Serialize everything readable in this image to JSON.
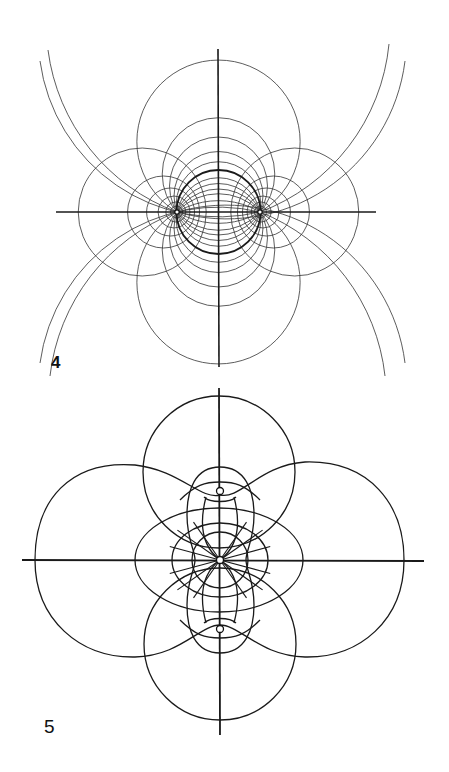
{
  "page": {
    "background": "#ffffff",
    "ink": "#1a1a1a"
  },
  "figures": [
    {
      "id": "figure-4",
      "label": "4",
      "description": "Field lines and equipotentials of two point charges (bipolar coordinate grid)",
      "axes": {
        "horizontal": {
          "x1": 56,
          "y1": 212,
          "x2": 376,
          "y2": 212
        },
        "vertical": {
          "x1": 218,
          "y1": 49,
          "x2": 219,
          "y2": 367
        }
      },
      "charges": [
        {
          "name": "left-charge",
          "x": 177,
          "y": 212
        },
        {
          "name": "right-charge",
          "x": 260,
          "y": 212
        }
      ],
      "center": {
        "x": 218.5,
        "y": 212
      },
      "half_separation": 41.5,
      "bold_circle": {
        "cx": 218.5,
        "cy": 212,
        "r": 42
      },
      "through_circle_offsets": [
        8,
        16,
        26,
        38,
        70.3
      ],
      "apollonian_radii": [
        6,
        10,
        16,
        24,
        36,
        64
      ],
      "leaf_arcs": [
        {
          "d": "M40,61 A180,180 0 0 0 260,212"
        },
        {
          "d": "M405,61 A180,180 0 0 1 177,212"
        },
        {
          "d": "M40,363 A180,180 0 0 1 260,212"
        },
        {
          "d": "M405,363 A180,180 0 0 0 177,212"
        },
        {
          "d": "M48,50 A200,200 0 0 0 177,212"
        },
        {
          "d": "M389,44 A200,200 0 0 1 260,212"
        },
        {
          "d": "M50,376 A200,200 0 0 1 177,212"
        },
        {
          "d": "M385,376 A200,200 0 0 0 260,212"
        }
      ],
      "clip": {
        "x": 38,
        "y": 42,
        "w": 370,
        "h": 338
      }
    },
    {
      "id": "figure-5",
      "label": "5",
      "description": "Field pattern with central charge and two axial charges",
      "axes": {
        "horizontal": {
          "x1": 22,
          "y1": 560,
          "x2": 424,
          "y2": 561
        },
        "vertical": {
          "x1": 219,
          "y1": 388,
          "x2": 220,
          "y2": 735
        }
      },
      "center": {
        "x": 220,
        "y": 560
      },
      "small_charges": [
        {
          "name": "top-charge",
          "x": 220,
          "y": 491,
          "r": 3.5
        },
        {
          "name": "bottom-charge",
          "x": 220,
          "y": 629,
          "r": 3.5
        },
        {
          "name": "center-charge",
          "x": 220,
          "y": 560,
          "r": 3.5
        }
      ],
      "circles": [
        {
          "name": "top-circle",
          "cx": 219,
          "cy": 472,
          "r": 76
        },
        {
          "name": "bottom-circle",
          "cx": 220,
          "cy": 644,
          "r": 76
        }
      ],
      "ovals": [
        {
          "name": "middle-oval",
          "cx": 219,
          "cy": 560,
          "rx": 84,
          "ry": 52
        },
        {
          "name": "inner-oval-1",
          "cx": 220,
          "cy": 560,
          "rx": 48,
          "ry": 37
        },
        {
          "name": "inner-oval-2",
          "cx": 220,
          "cy": 560,
          "rx": 28,
          "ry": 28
        }
      ],
      "paths": [
        {
          "name": "left-lobe",
          "d": "M220,495 C200,500 180,470 135,465 C70,460 35,500 35,560 C35,620 80,658 135,657 C180,656 200,625 220,625"
        },
        {
          "name": "right-lobe",
          "d": "M220,495 C240,500 260,465 305,462 C370,460 404,505 404,560 C404,620 360,658 305,657 C260,656 240,625 220,625"
        },
        {
          "name": "inner-lobe",
          "d": "M220,467 C245,467 254,490 254,515 C254,540 246,550 246,560 C246,570 254,580 254,605 C254,630 245,653 220,653 C195,653 187,630 187,605 C187,580 195,570 195,560 C195,550 187,540 187,515 C187,490 195,467 220,467 Z"
        },
        {
          "name": "top-eye",
          "d": "M180,500 C195,485 205,482 220,482 C235,482 245,485 260,500"
        },
        {
          "name": "top-eye-lower",
          "d": "M204,497 C210,503 230,503 236,497"
        },
        {
          "name": "bottom-eye",
          "d": "M180,620 C195,635 205,638 220,638 C235,638 245,635 260,620"
        },
        {
          "name": "bottom-eye-upper",
          "d": "M204,623 C210,617 230,617 236,623"
        },
        {
          "name": "left-inner-curve",
          "d": "M206,497 C200,520 200,545 220,560 C200,575 200,600 206,623"
        },
        {
          "name": "right-inner-curve",
          "d": "M234,497 C240,520 240,545 220,560 C240,575 240,600 234,623"
        }
      ],
      "radial_angles": [
        15,
        35,
        55,
        125,
        145,
        165,
        195,
        215,
        235,
        305,
        325,
        345
      ],
      "radial_length": 84
    }
  ]
}
